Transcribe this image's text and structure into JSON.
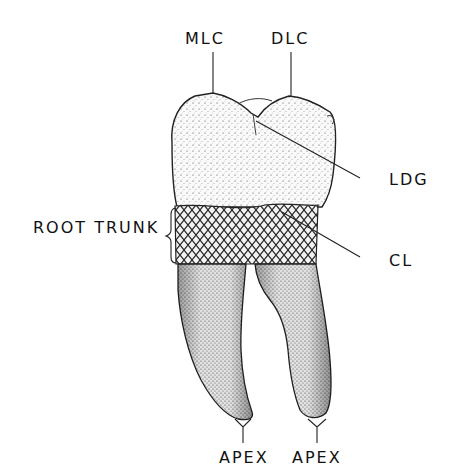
{
  "diagram": {
    "labels": {
      "mlc": "MLC",
      "dlc": "DLC",
      "ldg": "LDG",
      "root_trunk": "ROOT TRUNK",
      "cl": "CL",
      "apex_mesial": "APEX",
      "apex_distal": "APEX"
    },
    "colors": {
      "ink": "#111111",
      "background": "#ffffff",
      "stipple": "#2a2a2a"
    }
  }
}
